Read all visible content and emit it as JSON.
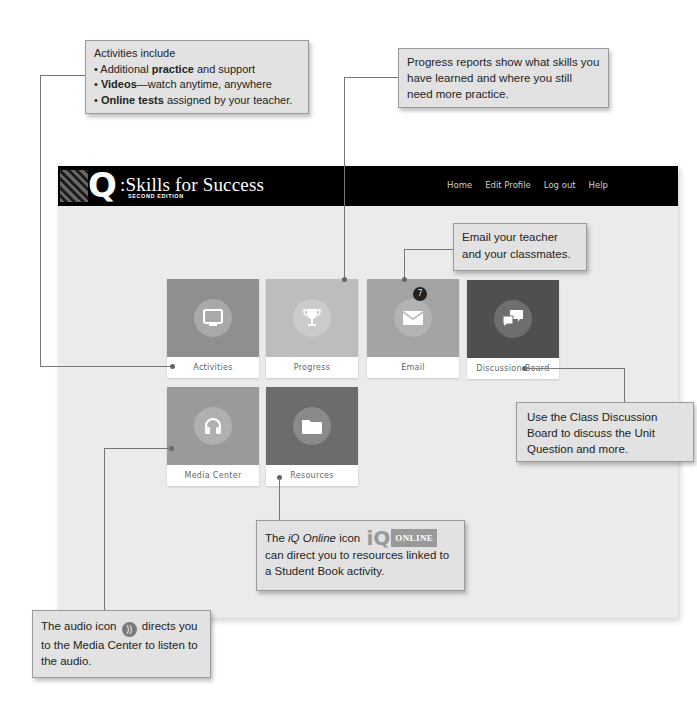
{
  "app": {
    "logo_letter": "Q",
    "title": ":Skills for Success",
    "subtitle": "SECOND EDITION",
    "nav": [
      "Home",
      "Edit Profile",
      "Log out",
      "Help"
    ]
  },
  "tiles": [
    {
      "label": "Activities",
      "icon": "monitor-icon",
      "color": "#8f8f8f"
    },
    {
      "label": "Progress",
      "icon": "trophy-icon",
      "color": "#bdbdbd"
    },
    {
      "label": "Email",
      "icon": "envelope-icon",
      "color": "#a3a3a3",
      "badge": "7"
    },
    {
      "label": "Discussion Board",
      "icon": "chat-bubbles-icon",
      "color": "#4f4f4f"
    },
    {
      "label": "Media Center",
      "icon": "headphones-icon",
      "color": "#9a9a9a"
    },
    {
      "label": "Resources",
      "icon": "folder-icon",
      "color": "#6c6c6c"
    }
  ],
  "callouts": {
    "activities": {
      "intro": "Activities include",
      "b1_pre": "• Additional ",
      "b1_bold": "practice",
      "b1_post": " and support",
      "b2_pre": "• ",
      "b2_bold": "Videos",
      "b2_post": "—watch anytime, anywhere",
      "b3_pre": "• ",
      "b3_bold": "Online tests",
      "b3_post": " assigned by your teacher."
    },
    "progress": "Progress reports show what skills you have learned and where you still need more practice.",
    "email": "Email your teacher and your classmates.",
    "discussion": "Use the Class Discussion Board to discuss the Unit Question and more.",
    "iq_online": {
      "pre": "The ",
      "italic": "iQ Online",
      "post": " icon",
      "logo_iq": "iQ",
      "logo_online": "ONLINE",
      "rest": "can direct you to resources linked to a Student Book activity."
    },
    "audio": {
      "pre": "The audio icon",
      "icon": "))",
      "post": "directs you to the Media Center to listen to the audio."
    }
  }
}
